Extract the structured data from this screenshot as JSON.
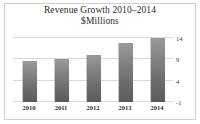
{
  "chart_data": {
    "type": "bar",
    "title": "Revenue Growth 2010–2014",
    "subtitle": "$Millions",
    "xlabel": "",
    "ylabel": "",
    "categories": [
      "2010",
      "2011",
      "2012",
      "2013",
      "2014"
    ],
    "values": [
      8.5,
      9,
      10,
      12.8,
      14
    ],
    "ylim": [
      -1,
      14
    ],
    "yticks": [
      14,
      9,
      4,
      -1
    ],
    "ytick_labels": [
      "14",
      "9",
      "4",
      "-1"
    ],
    "grid": true,
    "legend": null,
    "series_color": "#7c7c7c",
    "gridline_color": "#d8d8d8",
    "frame_color": "#cfcfcf",
    "background_color": "#ffffff",
    "text_color": "#2b2b2b"
  }
}
